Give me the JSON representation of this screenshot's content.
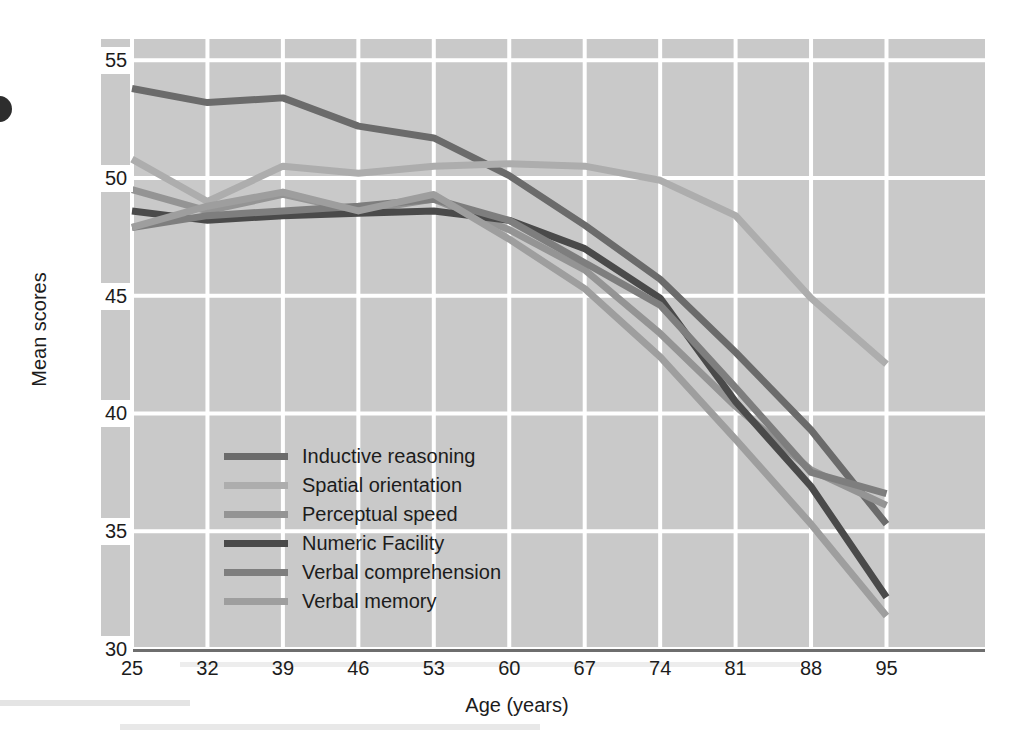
{
  "chart_data": {
    "type": "line",
    "title": "",
    "xlabel": "Age (years)",
    "ylabel": "Mean scores",
    "x": [
      25,
      32,
      39,
      46,
      53,
      60,
      67,
      74,
      81,
      88,
      95
    ],
    "xticklabels": [
      "25",
      "32",
      "39",
      "46",
      "53",
      "60",
      "67",
      "74",
      "81",
      "88",
      "95"
    ],
    "yticklabels": [
      "55",
      "50",
      "45",
      "40",
      "35",
      "30"
    ],
    "yticks": [
      55,
      50,
      45,
      40,
      35,
      30
    ],
    "xlim": [
      25,
      99
    ],
    "ylim": [
      30,
      55.9
    ],
    "grid": true,
    "legend_position": "inside-lower-left",
    "plot_background": "#c9c9c9",
    "grid_color": "#ffffff",
    "series": [
      {
        "name": "Inductive reasoning",
        "color": "#6b6b6b",
        "values": [
          53.8,
          53.2,
          53.4,
          52.2,
          51.7,
          50.1,
          48.0,
          45.7,
          42.6,
          39.3,
          35.3
        ]
      },
      {
        "name": "Spatial orientation",
        "color": "#adadad",
        "values": [
          50.8,
          49.0,
          50.5,
          50.2,
          50.5,
          50.6,
          50.5,
          49.9,
          48.4,
          44.9,
          42.1
        ]
      },
      {
        "name": "Perceptual speed",
        "color": "#949494",
        "values": [
          49.5,
          48.6,
          49.3,
          48.6,
          49.1,
          47.8,
          46.1,
          43.4,
          40.3,
          37.6,
          36.1
        ]
      },
      {
        "name": "Numeric Facility",
        "color": "#4a4a4a",
        "values": [
          48.6,
          48.2,
          48.4,
          48.5,
          48.6,
          48.2,
          47.0,
          44.9,
          40.5,
          36.9,
          32.2
        ]
      },
      {
        "name": "Verbal comprehension",
        "color": "#7e7e7e",
        "values": [
          47.9,
          48.4,
          48.6,
          48.8,
          49.1,
          48.2,
          46.4,
          44.6,
          41.1,
          37.5,
          36.6
        ]
      },
      {
        "name": "Verbal memory",
        "color": "#9e9e9e",
        "values": [
          47.9,
          48.8,
          49.4,
          48.6,
          49.3,
          47.4,
          45.3,
          42.4,
          38.9,
          35.3,
          31.4
        ]
      }
    ]
  },
  "legend": {
    "items": [
      {
        "label": "Inductive reasoning",
        "color": "#6b6b6b"
      },
      {
        "label": "Spatial orientation",
        "color": "#adadad"
      },
      {
        "label": "Perceptual speed",
        "color": "#949494"
      },
      {
        "label": "Numeric Facility",
        "color": "#4a4a4a"
      },
      {
        "label": "Verbal comprehension",
        "color": "#7e7e7e"
      },
      {
        "label": "Verbal memory",
        "color": "#9e9e9e"
      }
    ]
  }
}
